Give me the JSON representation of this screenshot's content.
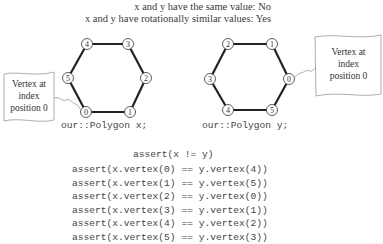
{
  "header": {
    "line1": "x and y have the same value: No",
    "line2": "x and y have rotationally similar values: Yes"
  },
  "polygons": [
    {
      "name": "x",
      "declaration": "our::Polygon x;",
      "vertex_labels_clockwise_from_bottom_left": [
        "0",
        "1",
        "2",
        "3",
        "4",
        "5"
      ],
      "callout": {
        "line1": "Vertex at",
        "line2": "index",
        "line3": "position 0"
      }
    },
    {
      "name": "y",
      "declaration": "our::Polygon y;",
      "vertex_labels": [
        "0",
        "1",
        "2",
        "3",
        "4",
        "5"
      ],
      "callout": {
        "line1": "Vertex at",
        "line2": "index",
        "line3": "position 0"
      }
    }
  ],
  "code": {
    "inequality": "assert(x != y)",
    "lines": [
      "assert(x.vertex(0) == y.vertex(4))",
      "assert(x.vertex(1) == y.vertex(5))",
      "assert(x.vertex(2) == y.vertex(0))",
      "assert(x.vertex(3) == y.vertex(1))",
      "assert(x.vertex(4) == y.vertex(2))",
      "assert(x.vertex(5) == y.vertex(3))"
    ]
  }
}
